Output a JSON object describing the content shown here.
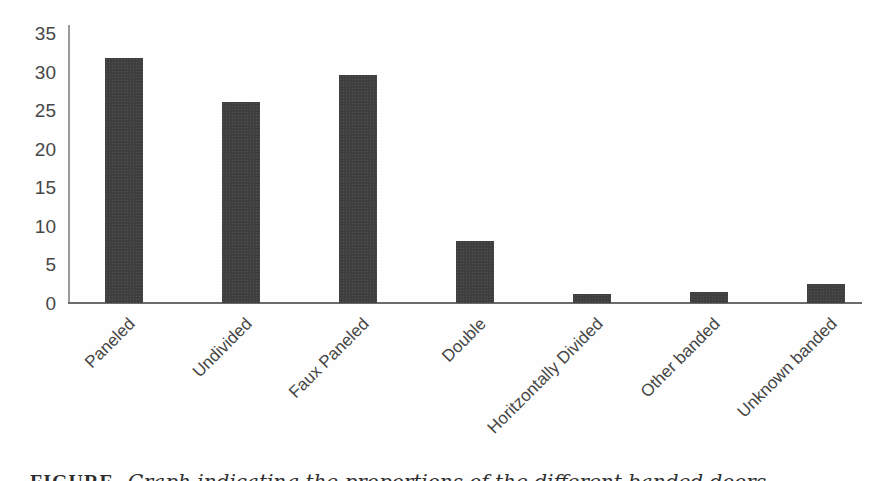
{
  "chart_data": {
    "type": "bar",
    "title": "",
    "xlabel": "",
    "ylabel": "",
    "categories": [
      "Paneled",
      "Undivided",
      "Faux Paneled",
      "Double",
      "Horitzontally Divided",
      "Other banded",
      "Unknown banded"
    ],
    "values": [
      31.7,
      26.1,
      29.5,
      8.0,
      1.2,
      1.4,
      2.4
    ],
    "ylim": [
      0,
      35
    ],
    "yticks": [
      0,
      5,
      10,
      15,
      20,
      25,
      30,
      35
    ],
    "grid": false,
    "legend": "none",
    "bar_color": "#3f3f3f",
    "axis_color": "#6b6b6b",
    "tick_label_color": "#474747"
  },
  "caption": {
    "label": "FIGURE",
    "text": "Graph indicating the proportions of the different banded doors"
  }
}
